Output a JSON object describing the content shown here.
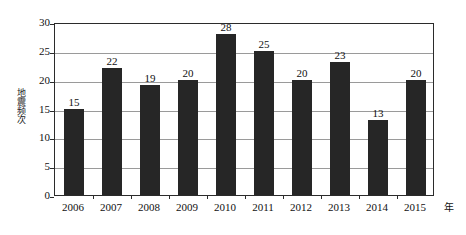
{
  "chart_data": {
    "type": "bar",
    "title": "",
    "subtitle": "",
    "xlabel": "年",
    "ylabel": "地震频次",
    "categories": [
      "2006",
      "2007",
      "2008",
      "2009",
      "2010",
      "2011",
      "2012",
      "2013",
      "2014",
      "2015"
    ],
    "values": [
      15,
      22,
      19,
      20,
      28,
      25,
      20,
      23,
      13,
      20
    ],
    "series": [
      {
        "name": "地震频次",
        "values": [
          15,
          22,
          19,
          20,
          28,
          25,
          20,
          23,
          13,
          20
        ]
      }
    ],
    "data_labels": [
      "15",
      "22",
      "19",
      "20",
      "28",
      "25",
      "20",
      "23",
      "13",
      "20"
    ],
    "ylim": [
      0,
      30
    ],
    "y_ticks": [
      0,
      5,
      10,
      15,
      20,
      25,
      30
    ],
    "y_tick_labels": [
      "0",
      "5",
      "10",
      "15",
      "20",
      "25",
      "30"
    ],
    "grid": true,
    "grid_axis": "y",
    "legend": null,
    "legend_position": "none",
    "bar_color": "#262626",
    "grid_color": "#9a9a9a",
    "frame_color": "#2b2b2b",
    "background_color": "#ffffff"
  },
  "axes": {
    "y_unit_label": "地震频次",
    "x_unit_label": "年"
  }
}
